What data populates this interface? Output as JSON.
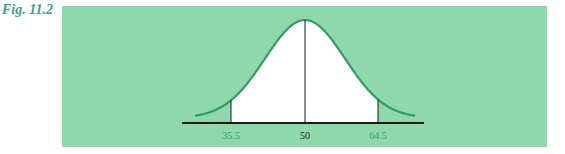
{
  "figure": {
    "label": "Fig. 11.2"
  },
  "colors": {
    "panel_bg": "#8fd8ac",
    "curve": "#2e9e62",
    "axis": "#1a1a1a",
    "shaded_region": "#ffffff",
    "tick_label_outer": "#3a9e6a",
    "tick_label_center": "#1a1a1a"
  },
  "chart_data": {
    "type": "area",
    "title": "",
    "distribution": {
      "mean": 50
    },
    "shaded_interval": [
      35.5,
      64.5
    ],
    "ticks": [
      {
        "value": 35.5,
        "label": "35.5"
      },
      {
        "value": 50,
        "label": "50"
      },
      {
        "value": 64.5,
        "label": "64.5"
      }
    ],
    "xlabel": "",
    "ylabel": "",
    "grid": false,
    "legend": null
  }
}
